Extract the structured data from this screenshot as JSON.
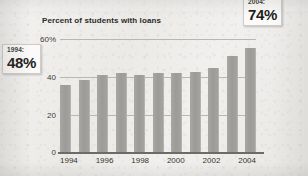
{
  "chart_data": {
    "type": "bar",
    "title": "Percent of students with loans",
    "xlabel": "",
    "ylabel": "",
    "ylim": [
      0,
      80
    ],
    "yticks": [
      0,
      20,
      40,
      60
    ],
    "ytick_labels": [
      "0",
      "20",
      "40",
      "60%"
    ],
    "grid": true,
    "legend": "none",
    "categories": [
      "1994",
      "1995",
      "1996",
      "1997",
      "1998",
      "1999",
      "2000",
      "2001",
      "2002",
      "2003",
      "2004"
    ],
    "xtick_labels": [
      "1994",
      "1996",
      "1998",
      "2000",
      "2002",
      "2004"
    ],
    "values": [
      48,
      51,
      55,
      56,
      55,
      56,
      56,
      57,
      60,
      68,
      74
    ],
    "annotations": [
      {
        "label": "1994:",
        "value": "48%",
        "year": 1994,
        "percent": 48
      },
      {
        "label": "2004:",
        "value": "74%",
        "year": 2004,
        "percent": 74
      }
    ]
  },
  "chart": {
    "title": "Percent of students with loans",
    "axis": {
      "y_labels": [
        "60%",
        "40",
        "20",
        "0"
      ],
      "x_labels": [
        "1994",
        "1996",
        "1998",
        "2000",
        "2002",
        "2004"
      ]
    }
  },
  "callouts": {
    "start": {
      "year_label": "1994:",
      "percent_label": "48%"
    },
    "end": {
      "year_label": "2004:",
      "percent_label": "74%"
    }
  },
  "colors": {
    "bar": "#9d9b97",
    "gridline": "#b9b7b3",
    "axis": "#6d6b68",
    "paper": "#efedeb",
    "text": "#2a2a28",
    "callout_bg": "#fbfaf8"
  }
}
